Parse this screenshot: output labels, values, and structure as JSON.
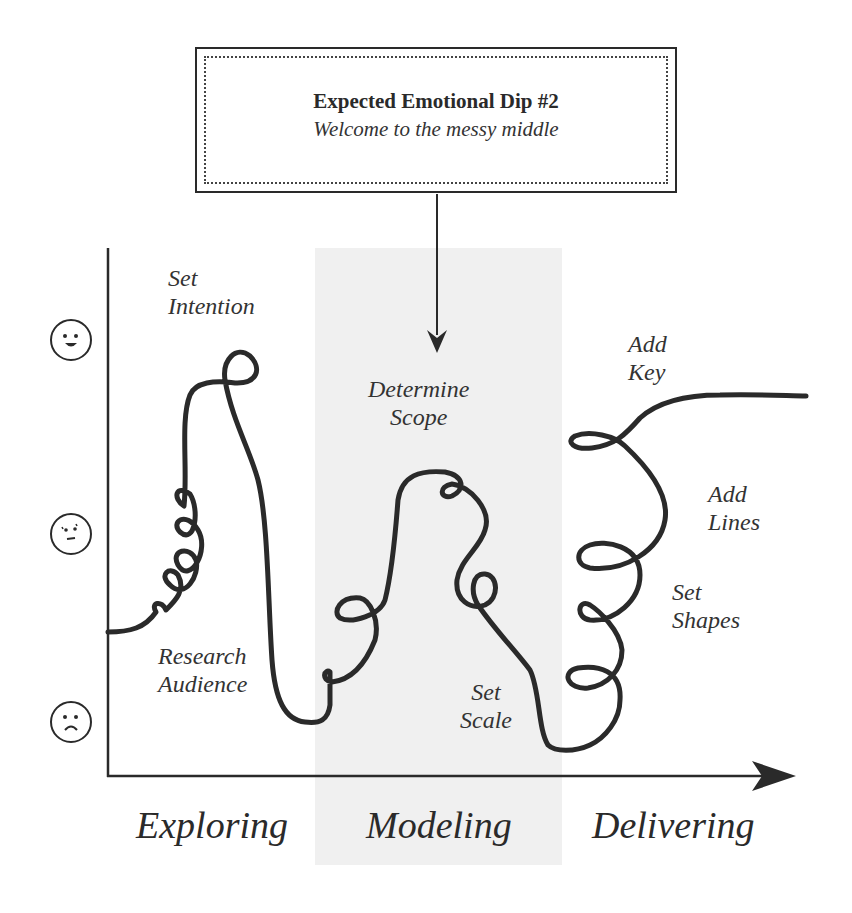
{
  "callout": {
    "title": "Expected Emotional Dip #2",
    "subtitle": "Welcome to the messy middle"
  },
  "y_axis": {
    "levels": [
      {
        "icon": "happy-face-icon",
        "meaning": "positive"
      },
      {
        "icon": "uncertain-face-icon",
        "meaning": "neutral"
      },
      {
        "icon": "sad-face-icon",
        "meaning": "negative"
      }
    ]
  },
  "steps": {
    "set_intention": "Set\nIntention",
    "research_audience": "Research\nAudience",
    "determine_scope": "Determine\nScope",
    "set_scale": "Set\nScale",
    "add_key": "Add\nKey",
    "add_lines": "Add\nLines",
    "set_shapes": "Set\nShapes"
  },
  "phases": {
    "exploring": "Exploring",
    "modeling": "Modeling",
    "delivering": "Delivering"
  },
  "colors": {
    "ink": "#2a2a2a",
    "highlight_band": "#f0f0f0"
  }
}
